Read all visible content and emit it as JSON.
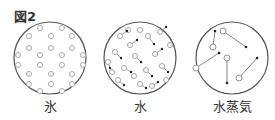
{
  "figure": {
    "label": "図2",
    "panels": [
      {
        "name": "ice",
        "caption": "氷"
      },
      {
        "name": "water",
        "caption": "水"
      },
      {
        "name": "steam",
        "caption": "水蒸気"
      }
    ]
  },
  "colors": {
    "line": "#444444",
    "background": "#ffffff"
  }
}
